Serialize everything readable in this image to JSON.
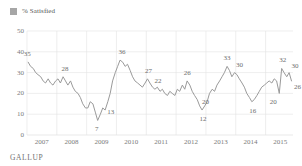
{
  "legend": {
    "label": "% Satisfied",
    "swatch_color": "#a6a6a6",
    "icon": "square-swatch-icon"
  },
  "footer": {
    "brand": "GALLUP"
  },
  "chart_data": {
    "type": "line",
    "title": "",
    "subtitle": "",
    "xlabel": "",
    "ylabel": "",
    "ylim": [
      0,
      50
    ],
    "yticks": [
      0,
      10,
      20,
      30,
      40,
      50
    ],
    "xlim": [
      2007.0,
      2015.92
    ],
    "xticks": [
      2007,
      2008,
      2009,
      2010,
      2011,
      2012,
      2013,
      2014,
      2015
    ],
    "xtick_labels": [
      "2007",
      "2008",
      "2009",
      "2010",
      "2011",
      "2012",
      "2013",
      "2014",
      "2015"
    ],
    "grid": "vertical-yearly-and-horizontal-yticks",
    "legend_position": "top-left",
    "line_color": "#9a9a9a",
    "series": [
      {
        "name": "% Satisfied",
        "x": [
          2007.04,
          2007.12,
          2007.21,
          2007.29,
          2007.37,
          2007.46,
          2007.54,
          2007.62,
          2007.71,
          2007.79,
          2007.87,
          2007.96,
          2008.04,
          2008.12,
          2008.21,
          2008.29,
          2008.37,
          2008.46,
          2008.54,
          2008.62,
          2008.71,
          2008.79,
          2008.87,
          2008.96,
          2009.04,
          2009.12,
          2009.21,
          2009.29,
          2009.37,
          2009.46,
          2009.54,
          2009.62,
          2009.71,
          2009.79,
          2009.87,
          2009.96,
          2010.04,
          2010.12,
          2010.21,
          2010.29,
          2010.37,
          2010.46,
          2010.54,
          2010.62,
          2010.71,
          2010.79,
          2010.87,
          2010.96,
          2011.04,
          2011.12,
          2011.21,
          2011.29,
          2011.37,
          2011.46,
          2011.54,
          2011.62,
          2011.71,
          2011.79,
          2011.87,
          2011.96,
          2012.04,
          2012.12,
          2012.21,
          2012.29,
          2012.37,
          2012.46,
          2012.54,
          2012.62,
          2012.71,
          2012.79,
          2012.87,
          2012.96,
          2013.04,
          2013.12,
          2013.21,
          2013.29,
          2013.37,
          2013.46,
          2013.54,
          2013.62,
          2013.71,
          2013.79,
          2013.87,
          2013.96,
          2014.04,
          2014.12,
          2014.21,
          2014.29,
          2014.37,
          2014.46,
          2014.54,
          2014.62,
          2014.71,
          2014.79,
          2014.87,
          2014.96,
          2015.04,
          2015.12,
          2015.21,
          2015.29,
          2015.37,
          2015.46,
          2015.54,
          2015.62,
          2015.71,
          2015.79,
          2015.87
        ],
        "values": [
          35,
          33,
          32,
          30,
          29,
          28,
          26,
          25,
          27,
          25,
          24,
          26,
          27,
          25,
          28,
          26,
          24,
          26,
          23,
          21,
          20,
          18,
          15,
          13,
          13,
          16,
          15,
          11,
          7,
          10,
          13,
          12,
          16,
          20,
          26,
          30,
          33,
          36,
          35,
          33,
          34,
          31,
          28,
          26,
          25,
          24,
          23,
          25,
          27,
          25,
          23,
          22,
          23,
          21,
          22,
          20,
          19,
          21,
          20,
          19,
          22,
          21,
          24,
          22,
          26,
          24,
          21,
          19,
          17,
          14,
          12,
          14,
          16,
          20,
          22,
          21,
          24,
          26,
          28,
          30,
          33,
          31,
          28,
          30,
          29,
          27,
          25,
          23,
          20,
          18,
          16,
          17,
          19,
          21,
          23,
          24,
          25,
          26,
          25,
          27,
          26,
          20,
          32,
          30,
          28,
          30,
          26
        ]
      }
    ],
    "annotations": [
      {
        "label": "35",
        "x": 2007.04,
        "y": 35,
        "dx": -1,
        "dy": -8
      },
      {
        "label": "28",
        "x": 2008.21,
        "y": 28,
        "dx": 2,
        "dy": -8
      },
      {
        "label": "7",
        "x": 2009.37,
        "y": 7,
        "dx": -1,
        "dy": 9
      },
      {
        "label": "13",
        "x": 2009.54,
        "y": 13,
        "dx": 8,
        "dy": 4
      },
      {
        "label": "36",
        "x": 2010.12,
        "y": 36,
        "dx": 2,
        "dy": -8
      },
      {
        "label": "27",
        "x": 2011.04,
        "y": 27,
        "dx": 1,
        "dy": -8
      },
      {
        "label": "22",
        "x": 2011.29,
        "y": 22,
        "dx": 3,
        "dy": -8
      },
      {
        "label": "26",
        "x": 2012.37,
        "y": 26,
        "dx": 0,
        "dy": -8
      },
      {
        "label": "12",
        "x": 2012.87,
        "y": 12,
        "dx": 1,
        "dy": 9
      },
      {
        "label": "20",
        "x": 2013.12,
        "y": 20,
        "dx": -4,
        "dy": 9
      },
      {
        "label": "33",
        "x": 2013.71,
        "y": 33,
        "dx": 0,
        "dy": -8
      },
      {
        "label": "30",
        "x": 2013.96,
        "y": 30,
        "dx": 5,
        "dy": -8
      },
      {
        "label": "16",
        "x": 2014.54,
        "y": 16,
        "dx": 1,
        "dy": 9
      },
      {
        "label": "20",
        "x": 2015.46,
        "y": 20,
        "dx": -6,
        "dy": 9
      },
      {
        "label": "32",
        "x": 2015.54,
        "y": 32,
        "dx": 1,
        "dy": -8
      },
      {
        "label": "30",
        "x": 2015.79,
        "y": 30,
        "dx": 6,
        "dy": -7
      },
      {
        "label": "26",
        "x": 2015.87,
        "y": 26,
        "dx": 6,
        "dy": 6
      }
    ]
  }
}
